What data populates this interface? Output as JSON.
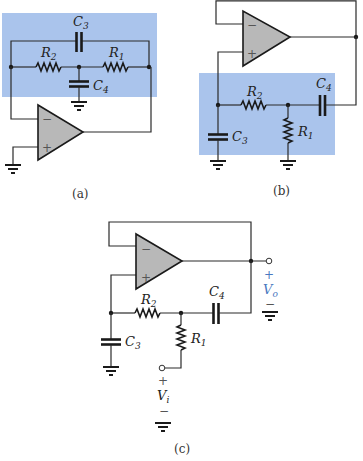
{
  "figure": {
    "colors": {
      "highlight": "#aac4ec",
      "opamp_fill": "#b8b8b8",
      "output_label": "#4a78c0"
    },
    "panels": [
      {
        "id": "a",
        "caption": "(a)",
        "components": {
          "C3": {
            "letter": "C",
            "sub": "3"
          },
          "C4": {
            "letter": "C",
            "sub": "4"
          },
          "R1": {
            "letter": "R",
            "sub": "1"
          },
          "R2": {
            "letter": "R",
            "sub": "2"
          }
        },
        "opamp": {
          "minus": "−",
          "plus": "+"
        }
      },
      {
        "id": "b",
        "caption": "(b)",
        "components": {
          "C3": {
            "letter": "C",
            "sub": "3"
          },
          "C4": {
            "letter": "C",
            "sub": "4"
          },
          "R1": {
            "letter": "R",
            "sub": "1"
          },
          "R2": {
            "letter": "R",
            "sub": "2"
          }
        },
        "opamp": {
          "minus": "−",
          "plus": "+"
        }
      },
      {
        "id": "c",
        "caption": "(c)",
        "components": {
          "C3": {
            "letter": "C",
            "sub": "3"
          },
          "C4": {
            "letter": "C",
            "sub": "4"
          },
          "R1": {
            "letter": "R",
            "sub": "1"
          },
          "R2": {
            "letter": "R",
            "sub": "2"
          }
        },
        "opamp": {
          "minus": "−",
          "plus": "+"
        },
        "output": {
          "plus": "+",
          "letter": "V",
          "sub": "o",
          "minus": "−"
        },
        "input": {
          "plus": "+",
          "letter": "V",
          "sub": "i",
          "minus": "−"
        }
      }
    ]
  }
}
